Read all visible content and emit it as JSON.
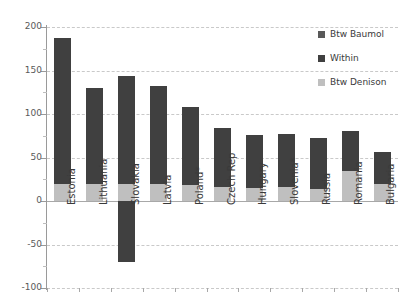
{
  "chart_data": {
    "type": "bar",
    "title": "",
    "subtitle": "",
    "xlabel": "",
    "ylabel": "",
    "ylim": [
      -100,
      200
    ],
    "yticks": [
      200,
      150,
      100,
      50,
      0,
      -50,
      -100
    ],
    "ytick_labels": [
      "200",
      "150",
      "100",
      "50",
      "0",
      "-50",
      "-100"
    ],
    "grid": true,
    "stacked": true,
    "legend_position": "top-right",
    "categories": [
      "Estonia",
      "Lithuania",
      "Slovakia",
      "Latvia",
      "Poland*",
      "Czech Rep",
      "Hungary",
      "Slovenia*",
      "Russia",
      "Romania",
      "Bulgaria"
    ],
    "series": [
      {
        "name": "Btw Denison",
        "color": "#bfbfbf",
        "values": [
          20,
          20,
          20,
          20,
          18,
          16,
          15,
          16,
          14,
          35,
          20
        ]
      },
      {
        "name": "Within",
        "color": "#404040",
        "values": [
          167,
          110,
          124,
          112,
          90,
          68,
          61,
          61,
          58,
          45,
          36
        ]
      },
      {
        "name": "Btw Baumol",
        "color": "#404040",
        "values": [
          0,
          0,
          -70,
          0,
          0,
          0,
          0,
          0,
          0,
          0,
          0
        ]
      }
    ],
    "totals": [
      187,
      130,
      144,
      132,
      108,
      84,
      76,
      77,
      72,
      80,
      56
    ]
  },
  "legend": {
    "items": [
      {
        "label": "Btw Baumol",
        "color": "#595959"
      },
      {
        "label": "Within",
        "color": "#404040"
      },
      {
        "label": "Btw Denison",
        "color": "#bfbfbf"
      }
    ]
  }
}
